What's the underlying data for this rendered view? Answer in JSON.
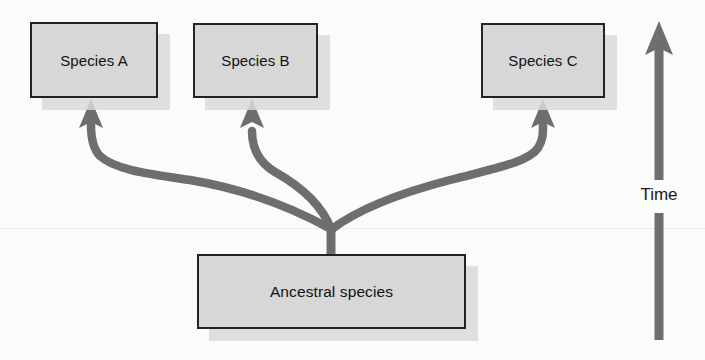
{
  "figure": {
    "kind": "phylogenetic-branching-diagram",
    "background_color": "#fbfbfa",
    "box_fill_color": "#d7d7d7",
    "box_border_color": "#232323",
    "shadow_color": "#d9d9d9",
    "branch_color": "#6e6e6e",
    "axis_color": "#6e6e6e",
    "text_color": "#121212"
  },
  "nodes": [
    {
      "id": "species_a",
      "label": "Species A",
      "x": 30,
      "y": 22,
      "w": 128,
      "h": 76
    },
    {
      "id": "species_b",
      "label": "Species B",
      "x": 193,
      "y": 23,
      "w": 125,
      "h": 75
    },
    {
      "id": "species_c",
      "label": "Species C",
      "x": 481,
      "y": 23,
      "w": 124,
      "h": 75
    },
    {
      "id": "ancestral",
      "label": "Ancestral species",
      "x": 197,
      "y": 254,
      "w": 269,
      "h": 75
    }
  ],
  "branches": [
    {
      "id": "branch_to_a",
      "from": "ancestral",
      "to": "species_a",
      "arrow_x": 91,
      "arrow_tip_y": 99
    },
    {
      "id": "branch_to_b",
      "from": "ancestral",
      "to": "species_b",
      "arrow_x": 252,
      "arrow_tip_y": 99
    },
    {
      "id": "branch_to_c",
      "from": "ancestral",
      "to": "species_c",
      "arrow_x": 543,
      "arrow_tip_y": 99
    }
  ],
  "junction": {
    "x": 331,
    "y": 228
  },
  "axis": {
    "label": "Time",
    "direction": "upward",
    "x": 659,
    "base_y": 340,
    "tip_y": 21,
    "label_center_y": 196
  },
  "scanline": {
    "y": 228
  }
}
